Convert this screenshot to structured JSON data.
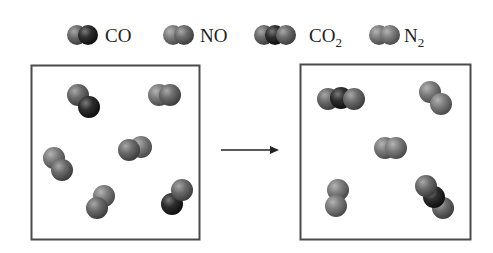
{
  "legend": [
    {
      "id": "co",
      "label": "CO",
      "sub": "",
      "atoms": [
        "O",
        "C"
      ]
    },
    {
      "id": "no",
      "label": "NO",
      "sub": "",
      "atoms": [
        "N",
        "O"
      ]
    },
    {
      "id": "co2",
      "label": "CO",
      "sub": "2",
      "atoms": [
        "O",
        "C",
        "O"
      ]
    },
    {
      "id": "n2",
      "label": "N",
      "sub": "2",
      "atoms": [
        "N",
        "N"
      ]
    }
  ],
  "atom_colors": {
    "C": "#2a2a2a",
    "O": "#6a6a6a",
    "N": "#7c7c7c"
  },
  "reactants": {
    "name": "before",
    "molecules": [
      {
        "type": "CO"
      },
      {
        "type": "NO"
      },
      {
        "type": "NO"
      },
      {
        "type": "NO"
      },
      {
        "type": "NO"
      },
      {
        "type": "CO"
      }
    ]
  },
  "arrow": {
    "direction": "right",
    "meaning": "reacts to form"
  },
  "products": {
    "name": "after",
    "molecules": [
      {
        "type": "CO2"
      },
      {
        "type": "N2"
      },
      {
        "type": "N2"
      },
      {
        "type": "N2"
      },
      {
        "type": "CO2"
      }
    ]
  }
}
